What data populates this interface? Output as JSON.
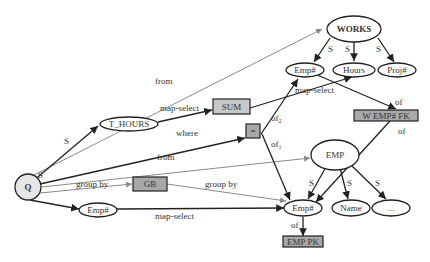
{
  "nodes": {
    "q": "Q",
    "works": "WORKS",
    "works_emp": "Emp#",
    "works_hours": "Hours",
    "works_proj": "Proj#",
    "t_hours": "T_HOURS",
    "sum": "SUM",
    "eq": "=",
    "w_emp_fk": "W EMP# FK",
    "emp": "EMP",
    "emp_emp": "Emp#",
    "emp_name": "Name",
    "emp_more": "...",
    "gb": "GB",
    "q_emp": "Emp#",
    "emp_pk": "EMP PK"
  },
  "edges": {
    "from_works": "from",
    "s_thours": "S",
    "map_select_sum": "map-select",
    "where": "where",
    "from_emp": "from",
    "group_by_q": "group by",
    "group_by_gb": "group by",
    "s_qemp": "S",
    "map_select_emp": "map-select",
    "map_select_hours": "map-select",
    "of2": "of₂",
    "of1": "of₁",
    "of_fk_top": "of",
    "of_fk_bottom": "of",
    "of_pk": "of",
    "s_works_emp": "S",
    "s_works_hours": "S",
    "s_works_proj": "S",
    "s_emp_emp": "S",
    "s_emp_name": "S",
    "s_emp_more": "S"
  },
  "colors": {
    "box_fill": "#a8a8a8",
    "node_fill_light": "#e6e6e6",
    "line_dark": "#222222",
    "line_gray": "#8a8a8a"
  }
}
